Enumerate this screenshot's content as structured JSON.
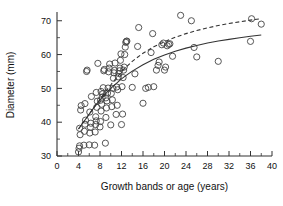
{
  "chart_data": {
    "type": "scatter",
    "title": "",
    "xlabel": "Growth bands or age (years)",
    "ylabel": "Diameter (mm)",
    "xlim": [
      0,
      40
    ],
    "ylim": [
      30,
      72
    ],
    "xticks": [
      0,
      4,
      8,
      12,
      16,
      20,
      24,
      28,
      32,
      36,
      40
    ],
    "xtick_labels": [
      "0",
      "4",
      "8",
      "12",
      "16",
      "20",
      "24",
      "28",
      "32",
      "36",
      "40"
    ],
    "xminor_step": 2,
    "yticks": [
      30,
      40,
      50,
      60,
      70
    ],
    "ytick_labels": [
      "30",
      "40",
      "50",
      "60",
      "70"
    ],
    "yminor_step": 5,
    "grid": false,
    "legend": "none",
    "marker": "open-circle",
    "marker_color": "#444444",
    "points": [
      [
        4.0,
        31.2
      ],
      [
        4.1,
        32.3
      ],
      [
        4.2,
        33.0
      ],
      [
        4.3,
        36.3
      ],
      [
        4.2,
        38.2
      ],
      [
        4.4,
        43.6
      ],
      [
        4.5,
        44.9
      ],
      [
        5.0,
        33.2
      ],
      [
        5.1,
        37.3
      ],
      [
        5.2,
        39.4
      ],
      [
        5.3,
        40.6
      ],
      [
        5.2,
        45.5
      ],
      [
        5.5,
        55.0
      ],
      [
        5.6,
        55.4
      ],
      [
        6.0,
        33.3
      ],
      [
        6.1,
        36.8
      ],
      [
        6.2,
        38.5
      ],
      [
        6.3,
        39.7
      ],
      [
        6.1,
        43.0
      ],
      [
        6.4,
        47.6
      ],
      [
        7.0,
        33.2
      ],
      [
        7.1,
        37.1
      ],
      [
        7.2,
        39.3
      ],
      [
        7.3,
        40.4
      ],
      [
        7.2,
        41.6
      ],
      [
        7.4,
        44.4
      ],
      [
        7.5,
        46.2
      ],
      [
        7.3,
        48.8
      ],
      [
        7.6,
        57.4
      ],
      [
        8.0,
        38.6
      ],
      [
        8.1,
        40.2
      ],
      [
        8.2,
        43.3
      ],
      [
        8.3,
        45.3
      ],
      [
        8.1,
        46.5
      ],
      [
        8.4,
        47.4
      ],
      [
        8.5,
        48.4
      ],
      [
        8.2,
        49.1
      ],
      [
        8.6,
        50.2
      ],
      [
        8.7,
        55.2
      ],
      [
        8.8,
        55.6
      ],
      [
        9.0,
        33.8
      ],
      [
        9.1,
        41.4
      ],
      [
        9.2,
        44.2
      ],
      [
        9.3,
        46.3
      ],
      [
        9.1,
        47.2
      ],
      [
        9.4,
        48.6
      ],
      [
        9.5,
        50.1
      ],
      [
        9.6,
        54.9
      ],
      [
        9.7,
        56.0
      ],
      [
        9.8,
        57.2
      ],
      [
        10.0,
        39.2
      ],
      [
        10.2,
        44.6
      ],
      [
        10.3,
        46.6
      ],
      [
        10.1,
        48.5
      ],
      [
        10.4,
        50.0
      ],
      [
        10.5,
        53.0
      ],
      [
        10.6,
        54.6
      ],
      [
        10.7,
        55.3
      ],
      [
        10.8,
        57.5
      ],
      [
        11.0,
        42.3
      ],
      [
        11.2,
        45.0
      ],
      [
        11.3,
        49.6
      ],
      [
        11.1,
        50.4
      ],
      [
        11.4,
        53.4
      ],
      [
        11.5,
        54.4
      ],
      [
        11.6,
        55.2
      ],
      [
        11.7,
        56.0
      ],
      [
        11.8,
        58.3
      ],
      [
        11.9,
        60.2
      ],
      [
        12.0,
        39.3
      ],
      [
        12.2,
        42.4
      ],
      [
        12.1,
        50.5
      ],
      [
        12.3,
        53.2
      ],
      [
        12.4,
        55.4
      ],
      [
        12.5,
        56.3
      ],
      [
        12.6,
        60.0
      ],
      [
        12.7,
        62.2
      ],
      [
        12.8,
        63.6
      ],
      [
        12.9,
        63.9
      ],
      [
        13.0,
        64.0
      ],
      [
        14.0,
        50.3
      ],
      [
        14.5,
        54.3
      ],
      [
        15.0,
        62.4
      ],
      [
        15.2,
        68.0
      ],
      [
        16.0,
        45.6
      ],
      [
        16.5,
        50.0
      ],
      [
        17.0,
        50.3
      ],
      [
        17.5,
        60.6
      ],
      [
        17.8,
        66.2
      ],
      [
        18.0,
        50.5
      ],
      [
        18.5,
        55.4
      ],
      [
        18.8,
        56.8
      ],
      [
        19.0,
        57.8
      ],
      [
        19.5,
        62.9
      ],
      [
        19.8,
        63.4
      ],
      [
        20.0,
        55.4
      ],
      [
        20.2,
        56.3
      ],
      [
        20.5,
        62.6
      ],
      [
        20.8,
        63.0
      ],
      [
        21.0,
        63.2
      ],
      [
        21.5,
        59.5
      ],
      [
        23.0,
        71.6
      ],
      [
        25.0,
        70.0
      ],
      [
        25.5,
        62.1
      ],
      [
        26.0,
        59.3
      ],
      [
        30.0,
        58.0
      ],
      [
        36.0,
        63.9
      ],
      [
        36.2,
        70.6
      ],
      [
        38.0,
        69.0
      ]
    ],
    "curves": [
      {
        "name": "upper-fit",
        "style": "dashed",
        "x": [
          4,
          5,
          6,
          7,
          8,
          9,
          10,
          11,
          12,
          13,
          14,
          16,
          18,
          20,
          22,
          24,
          26,
          28,
          30,
          32,
          34,
          36,
          38
        ],
        "y": [
          38.0,
          40.2,
          42.4,
          44.6,
          46.8,
          49.0,
          51.0,
          53.0,
          54.9,
          56.5,
          58.0,
          60.4,
          62.3,
          63.8,
          65.1,
          66.2,
          67.1,
          67.9,
          68.6,
          69.2,
          69.7,
          70.2,
          70.6
        ]
      },
      {
        "name": "lower-fit",
        "style": "solid",
        "x": [
          4,
          5,
          6,
          7,
          8,
          9,
          10,
          11,
          12,
          13,
          14,
          16,
          18,
          20,
          22,
          24,
          26,
          28,
          30,
          32,
          34,
          36,
          38
        ],
        "y": [
          38.0,
          40.2,
          42.4,
          44.6,
          46.6,
          48.4,
          50.0,
          51.4,
          52.8,
          54.0,
          55.1,
          57.0,
          58.6,
          59.9,
          61.0,
          61.9,
          62.7,
          63.4,
          64.0,
          64.5,
          65.0,
          65.4,
          65.8
        ]
      }
    ]
  }
}
